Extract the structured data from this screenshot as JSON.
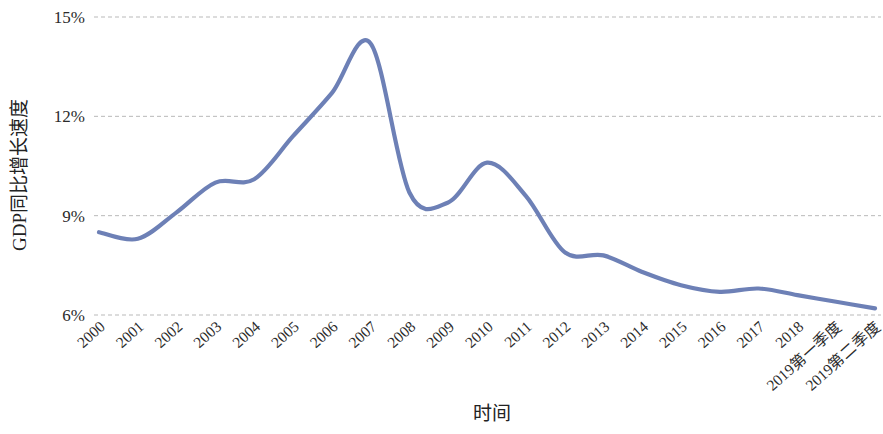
{
  "chart_data": {
    "type": "line",
    "title": "",
    "xlabel": "时间",
    "ylabel": "GDP同比增长速度",
    "categories": [
      "2000",
      "2001",
      "2002",
      "2003",
      "2004",
      "2005",
      "2006",
      "2007",
      "2008",
      "2009",
      "2010",
      "2011",
      "2012",
      "2013",
      "2014",
      "2015",
      "2016",
      "2017",
      "2018",
      "2019第一季度",
      "2019第二季度"
    ],
    "values": [
      8.5,
      8.3,
      9.1,
      10.0,
      10.1,
      11.4,
      12.7,
      14.2,
      9.7,
      9.4,
      10.6,
      9.6,
      7.9,
      7.8,
      7.3,
      6.9,
      6.7,
      6.8,
      6.6,
      6.4,
      6.2
    ],
    "series": [
      {
        "name": "GDP同比增长速度",
        "color": "#6d80b6",
        "values": [
          8.5,
          8.3,
          9.1,
          10.0,
          10.1,
          11.4,
          12.7,
          14.2,
          9.7,
          9.4,
          10.6,
          9.6,
          7.9,
          7.8,
          7.3,
          6.9,
          6.7,
          6.8,
          6.6,
          6.4,
          6.2
        ]
      }
    ],
    "yticks": [
      "6%",
      "9%",
      "12%",
      "15%"
    ],
    "ytick_values": [
      6,
      9,
      12,
      15
    ],
    "ylim": [
      5.4,
      15.3
    ],
    "grid": true,
    "legend": false,
    "smoothing": "spline"
  },
  "axes": {
    "y_axis_title": "GDP同比增长速度",
    "x_axis_title": "时间",
    "y_tick_labels": [
      "15%",
      "12%",
      "9%",
      "6%"
    ],
    "x_tick_labels": [
      "2000",
      "2001",
      "2002",
      "2003",
      "2004",
      "2005",
      "2006",
      "2007",
      "2008",
      "2009",
      "2010",
      "2011",
      "2012",
      "2013",
      "2014",
      "2015",
      "2016",
      "2017",
      "2018",
      "2019第一季度",
      "2019第二季度"
    ]
  },
  "style": {
    "line_color": "#6d80b6",
    "grid_color": "#b9b9b9",
    "text_color": "#2b2b2b",
    "background": "#ffffff"
  }
}
